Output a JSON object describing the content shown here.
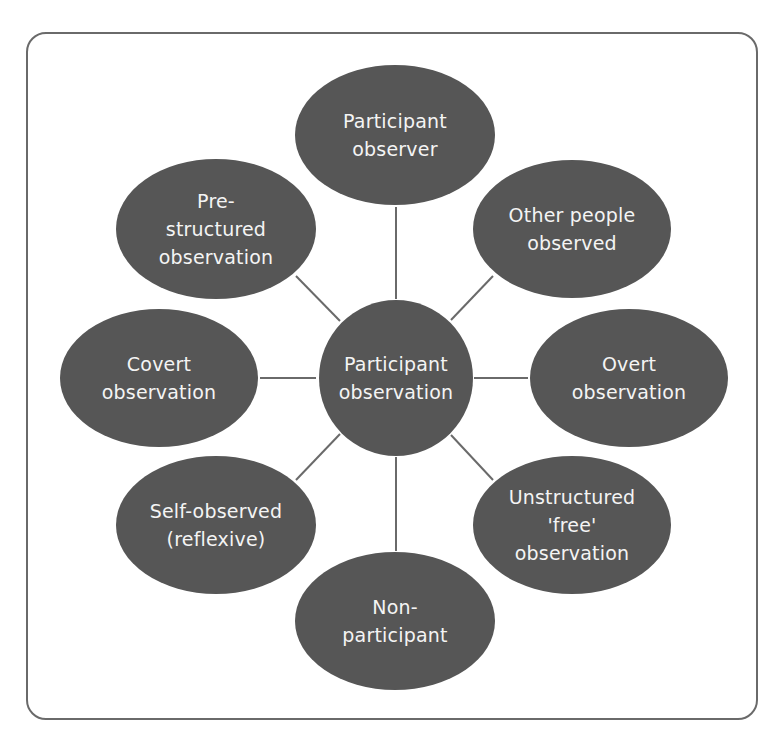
{
  "diagram": {
    "type": "hub-and-spoke",
    "center": {
      "id": "center",
      "lines": [
        "Participant",
        "observation"
      ],
      "cx": 396,
      "cy": 378,
      "rx": 77,
      "ry": 78
    },
    "nodes": [
      {
        "id": "participant-observer",
        "lines": [
          "Participant",
          "observer"
        ],
        "cx": 395,
        "cy": 135,
        "rx": 100,
        "ry": 70
      },
      {
        "id": "other-people-observed",
        "lines": [
          "Other people",
          "observed"
        ],
        "cx": 572,
        "cy": 229,
        "rx": 99,
        "ry": 69
      },
      {
        "id": "overt-observation",
        "lines": [
          "Overt",
          "observation"
        ],
        "cx": 629,
        "cy": 378,
        "rx": 99,
        "ry": 69
      },
      {
        "id": "unstructured-free-observation",
        "lines": [
          "Unstructured",
          "'free'",
          "observation"
        ],
        "cx": 572,
        "cy": 525,
        "rx": 99,
        "ry": 69
      },
      {
        "id": "non-participant",
        "lines": [
          "Non-",
          "participant"
        ],
        "cx": 395,
        "cy": 621,
        "rx": 100,
        "ry": 69
      },
      {
        "id": "self-observed-reflexive",
        "lines": [
          "Self-observed",
          "(reflexive)"
        ],
        "cx": 216,
        "cy": 525,
        "rx": 100,
        "ry": 69
      },
      {
        "id": "covert-observation",
        "lines": [
          "Covert",
          "observation"
        ],
        "cx": 159,
        "cy": 378,
        "rx": 99,
        "ry": 69
      },
      {
        "id": "pre-structured-observation",
        "lines": [
          "Pre-",
          "structured",
          "observation"
        ],
        "cx": 216,
        "cy": 229,
        "rx": 100,
        "ry": 70
      }
    ],
    "links": [
      {
        "x1": 396,
        "y1": 207,
        "x2": 396,
        "y2": 299
      },
      {
        "x1": 493,
        "y1": 276,
        "x2": 451,
        "y2": 320
      },
      {
        "x1": 528,
        "y1": 378,
        "x2": 474,
        "y2": 378
      },
      {
        "x1": 493,
        "y1": 480,
        "x2": 451,
        "y2": 435
      },
      {
        "x1": 396,
        "y1": 551,
        "x2": 396,
        "y2": 457
      },
      {
        "x1": 296,
        "y1": 480,
        "x2": 340,
        "y2": 434
      },
      {
        "x1": 260,
        "y1": 378,
        "x2": 316,
        "y2": 378
      },
      {
        "x1": 296,
        "y1": 276,
        "x2": 340,
        "y2": 321
      }
    ],
    "colors": {
      "node_fill": "#565656",
      "node_text": "#f4f4f4",
      "line": "#6a6a6a",
      "frame": "#6a6a6a"
    }
  }
}
